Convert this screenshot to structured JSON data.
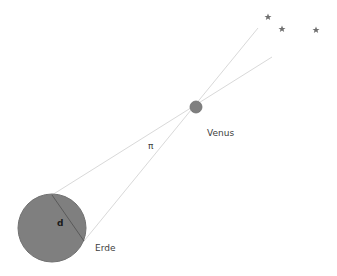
{
  "diagram": {
    "labels": {
      "venus": "Venus",
      "earth": "Erde",
      "distance": "d",
      "parallax_angle": "π"
    },
    "colors": {
      "planet_fill": "#7f7f7f",
      "planet_stroke": "#6e6e6e",
      "sight_line": "#d9d9d9",
      "star": "#6f6f6f",
      "text": "#404040"
    },
    "stars": [
      {
        "x": 268,
        "y": 17
      },
      {
        "x": 282,
        "y": 29
      },
      {
        "x": 316,
        "y": 30
      }
    ]
  }
}
